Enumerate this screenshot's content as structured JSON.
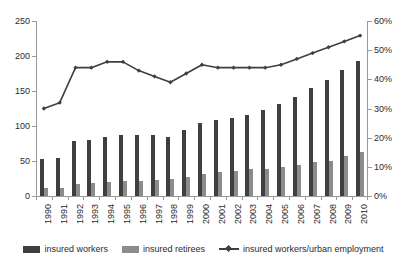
{
  "chart_data": {
    "type": "bar",
    "title": "",
    "xlabel": "",
    "ylabel": "",
    "grid": false,
    "legend_position": "bottom",
    "categories": [
      "1990",
      "1991",
      "1992",
      "1993",
      "1994",
      "1995",
      "1996",
      "1997",
      "1998",
      "1999",
      "2000",
      "2001",
      "2002",
      "2003",
      "2004",
      "2005",
      "2006",
      "2007",
      "2008",
      "2009",
      "2010"
    ],
    "left_axis": {
      "ylim": [
        0,
        250
      ],
      "ticks": [
        0,
        50,
        100,
        150,
        200,
        250
      ],
      "tick_labels": [
        "0",
        "50",
        "100",
        "150",
        "200",
        "250"
      ]
    },
    "right_axis": {
      "ylim": [
        0,
        60
      ],
      "ticks": [
        0,
        10,
        20,
        30,
        40,
        50,
        60
      ],
      "tick_labels": [
        "0%",
        "10%",
        "20%",
        "30%",
        "40%",
        "50%",
        "60%"
      ]
    },
    "series": [
      {
        "name": "insured workers",
        "kind": "bar",
        "axis": "left",
        "color": "#3f3f3f",
        "values": [
          53,
          55,
          79,
          80,
          85,
          87,
          87,
          87,
          85,
          95,
          105,
          108,
          111,
          116,
          123,
          131,
          142,
          155,
          166,
          180,
          193
        ]
      },
      {
        "name": "insured retirees",
        "kind": "bar",
        "axis": "left",
        "color": "#8c8c8c",
        "values": [
          11,
          12,
          17,
          18,
          20,
          21,
          22,
          23,
          25,
          27,
          32,
          34,
          36,
          38,
          39,
          41,
          44,
          48,
          50,
          57,
          63
        ]
      },
      {
        "name": "insured workers/urban employment",
        "kind": "line",
        "axis": "right",
        "color": "#3f3f3f",
        "values": [
          30,
          32,
          44,
          44,
          46,
          46,
          43,
          41,
          39,
          42,
          45,
          44,
          44,
          44,
          44,
          45,
          47,
          49,
          51,
          53,
          55
        ]
      }
    ]
  },
  "legend": {
    "items": [
      {
        "label": "insured workers",
        "marker": "square-dark-swatch"
      },
      {
        "label": "insured retirees",
        "marker": "square-light-swatch"
      },
      {
        "label": "insured workers/urban employment",
        "marker": "line-diamond-marker"
      }
    ]
  },
  "colors": {
    "bar_workers": "#3f3f3f",
    "bar_retirees": "#8c8c8c",
    "line": "#3f3f3f",
    "axis": "#9a9a9a",
    "text": "#2b2b2b",
    "background": "#ffffff"
  }
}
